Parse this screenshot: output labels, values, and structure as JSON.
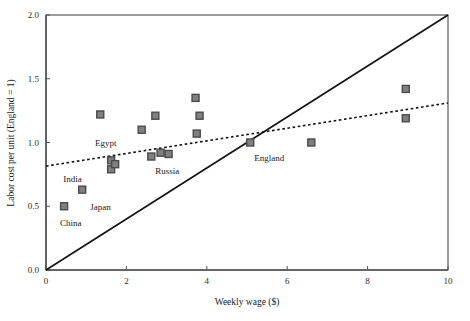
{
  "chart_data": {
    "type": "scatter",
    "title": "",
    "xlabel": "Weekly wage ($)",
    "ylabel": "Labor cost per unit (England = 1)",
    "xlim": [
      0,
      10
    ],
    "ylim": [
      0.0,
      2.0
    ],
    "xticks": [
      0,
      2,
      4,
      6,
      8,
      10
    ],
    "xtick_labels": [
      "0",
      "2",
      "4",
      "6",
      "8",
      "10"
    ],
    "yticks": [
      0.0,
      0.5,
      1.0,
      1.5,
      2.0
    ],
    "ytick_labels": [
      "0.0",
      "0.5",
      "1.0",
      "1.5",
      "2.0"
    ],
    "grid": false,
    "legend": "none",
    "marker": {
      "shape": "square",
      "fill": "#808080",
      "edge": "#4a4a4a",
      "size": 7
    },
    "points": [
      {
        "x": 0.45,
        "y": 0.5,
        "label": "China",
        "label_dx": -4,
        "label_dy": 20
      },
      {
        "x": 0.9,
        "y": 0.63,
        "label": "Japan",
        "label_dx": 8,
        "label_dy": 20
      },
      {
        "x": 1.35,
        "y": 1.22,
        "label": ""
      },
      {
        "x": 1.62,
        "y": 0.86,
        "label": "Egypt",
        "label_dx": -16,
        "label_dy": -14
      },
      {
        "x": 1.62,
        "y": 0.79,
        "label": ""
      },
      {
        "x": 1.72,
        "y": 0.83,
        "label": "India",
        "label_dx": -52,
        "label_dy": 18
      },
      {
        "x": 2.38,
        "y": 1.1,
        "label": ""
      },
      {
        "x": 2.62,
        "y": 0.89,
        "label": "Russia",
        "label_dx": 4,
        "label_dy": 17
      },
      {
        "x": 2.72,
        "y": 1.21,
        "label": ""
      },
      {
        "x": 2.85,
        "y": 0.92,
        "label": ""
      },
      {
        "x": 3.05,
        "y": 0.91,
        "label": ""
      },
      {
        "x": 3.72,
        "y": 1.35,
        "label": ""
      },
      {
        "x": 3.82,
        "y": 1.21,
        "label": ""
      },
      {
        "x": 3.75,
        "y": 1.07,
        "label": ""
      },
      {
        "x": 5.08,
        "y": 1.0,
        "label": "England",
        "label_dx": 4,
        "label_dy": 18
      },
      {
        "x": 6.6,
        "y": 1.0,
        "label": ""
      },
      {
        "x": 8.95,
        "y": 1.42,
        "label": ""
      },
      {
        "x": 8.95,
        "y": 1.19,
        "label": ""
      }
    ],
    "lines": [
      {
        "name": "diagonal-reference-line",
        "style": "solid",
        "color": "#111111",
        "width": 1.6,
        "x1": 0.0,
        "y1": 0.0,
        "x2": 10.0,
        "y2": 2.0
      },
      {
        "name": "regression-trend-line",
        "style": "dotted",
        "color": "#111111",
        "width": 1.6,
        "x1": 0.0,
        "y1": 0.815,
        "x2": 10.0,
        "y2": 1.31
      }
    ]
  }
}
